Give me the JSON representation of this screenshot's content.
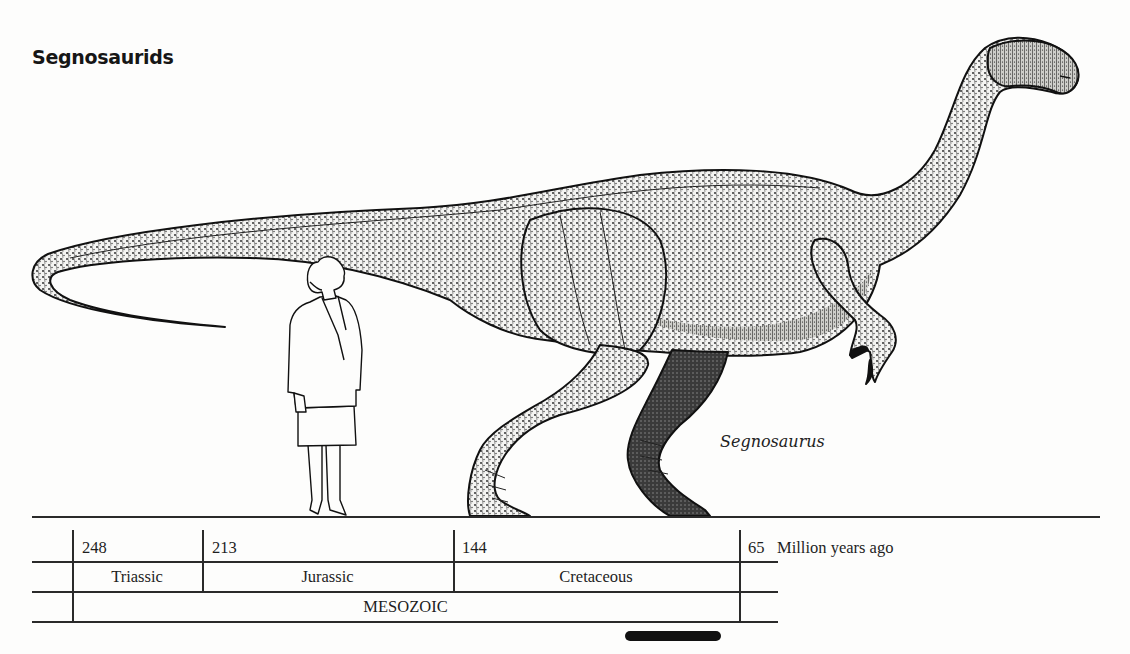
{
  "title": "Segnosaurids",
  "illustration": {
    "species_label": "Segnosaurus",
    "subjects": [
      "dinosaur-figure",
      "human-scale-figure"
    ],
    "ink_color": "#111111",
    "paper_color": "#fdfdfc"
  },
  "timeline": {
    "ticks": [
      {
        "value": "248",
        "x": 72
      },
      {
        "value": "213",
        "x": 202
      },
      {
        "value": "144",
        "x": 453
      },
      {
        "value": "65",
        "x": 740
      }
    ],
    "unit_label": "Million years ago",
    "periods": [
      {
        "label": "Triassic",
        "start": "248",
        "end": "213"
      },
      {
        "label": "Jurassic",
        "start": "213",
        "end": "144"
      },
      {
        "label": "Cretaceous",
        "start": "144",
        "end": "65"
      }
    ],
    "era": {
      "label": "MESOZOIC"
    },
    "highlight_bar": {
      "label": "segnosaur-range-bar",
      "color": "#111111"
    }
  }
}
